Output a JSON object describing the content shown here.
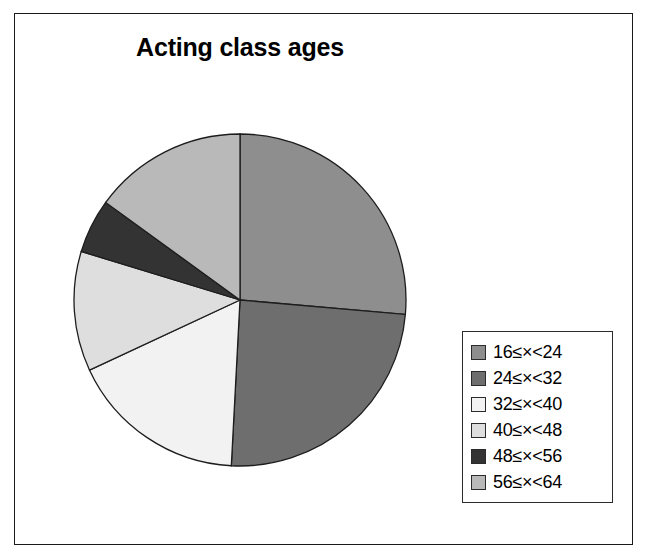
{
  "chart_data": {
    "type": "pie",
    "title": "Acting class ages",
    "xlabel": "",
    "ylabel": "",
    "legend_position": "right",
    "grid": false,
    "start_angle_deg": 0,
    "direction": "clockwise",
    "categories": [
      "16≤×<24",
      "24≤×<32",
      "32≤×<40",
      "40≤×<48",
      "48≤×<56",
      "56≤×<64"
    ],
    "values": [
      95,
      88,
      62,
      42,
      19,
      54
    ],
    "value_unit": "degrees",
    "colors": [
      "#8e8e8e",
      "#6e6e6e",
      "#f2f2f2",
      "#dedede",
      "#333333",
      "#b9b9b9"
    ]
  },
  "figure": {
    "title": "Acting class ages"
  },
  "legend": {
    "items": [
      {
        "label": "16≤×<24",
        "color": "#8e8e8e"
      },
      {
        "label": "24≤×<32",
        "color": "#6e6e6e"
      },
      {
        "label": "32≤×<40",
        "color": "#f2f2f2"
      },
      {
        "label": "40≤×<48",
        "color": "#dedede"
      },
      {
        "label": "48≤×<56",
        "color": "#333333"
      },
      {
        "label": "56≤×<64",
        "color": "#b9b9b9"
      }
    ]
  }
}
